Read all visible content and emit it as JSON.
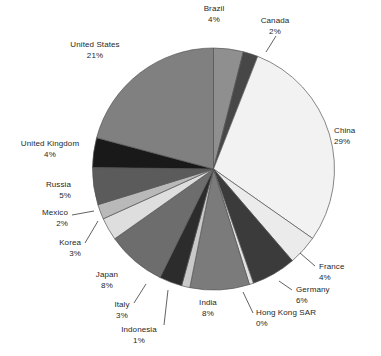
{
  "chart_data": {
    "type": "pie",
    "title": "",
    "subtitle": "",
    "xlabel": "",
    "ylabel": "",
    "legend_position": "none",
    "grid": false,
    "start_angle_deg": 0,
    "direction": "clockwise",
    "categories": [
      "Brazil",
      "Canada",
      "China",
      "France",
      "Germany",
      "Hong Kong SAR",
      "India",
      "Indonesia",
      "Italy",
      "Japan",
      "Korea",
      "Mexico",
      "Russia",
      "United Kingdom",
      "United States"
    ],
    "values": [
      4,
      2,
      29,
      4,
      6,
      0,
      8,
      1,
      3,
      8,
      3,
      2,
      5,
      4,
      21
    ],
    "value_unit": "%",
    "slices": [
      {
        "label": "Brazil",
        "pct_text": "4%",
        "value": 4,
        "sweep": 14.4,
        "color": "#8f8f8f"
      },
      {
        "label": "Canada",
        "pct_text": "2%",
        "value": 2,
        "sweep": 7.2,
        "color": "#474747"
      },
      {
        "label": "China",
        "pct_text": "29%",
        "value": 29,
        "sweep": 104.4,
        "color": "#f2f2f2"
      },
      {
        "label": "France",
        "pct_text": "4%",
        "value": 4,
        "sweep": 14.4,
        "color": "#ebebeb"
      },
      {
        "label": "Germany",
        "pct_text": "6%",
        "value": 6,
        "sweep": 21.6,
        "color": "#3b3b3b"
      },
      {
        "label": "Hong Kong SAR",
        "pct_text": "0%",
        "value": 0,
        "sweep": 2.0,
        "color": "#e2e2e2"
      },
      {
        "label": "India",
        "pct_text": "8%",
        "value": 8,
        "sweep": 28.8,
        "color": "#7b7b7b"
      },
      {
        "label": "Indonesia",
        "pct_text": "1%",
        "value": 1,
        "sweep": 4.0,
        "color": "#c9c9c9"
      },
      {
        "label": "Italy",
        "pct_text": "3%",
        "value": 3,
        "sweep": 11.0,
        "color": "#2c2c2c"
      },
      {
        "label": "Japan",
        "pct_text": "8%",
        "value": 8,
        "sweep": 28.8,
        "color": "#6d6d6d"
      },
      {
        "label": "Korea",
        "pct_text": "3%",
        "value": 3,
        "sweep": 11.0,
        "color": "#dedede"
      },
      {
        "label": "Mexico",
        "pct_text": "2%",
        "value": 2,
        "sweep": 7.2,
        "color": "#b9b9b9"
      },
      {
        "label": "Russia",
        "pct_text": "5%",
        "value": 5,
        "sweep": 18.0,
        "color": "#5b5b5b"
      },
      {
        "label": "United Kingdom",
        "pct_text": "4%",
        "value": 4,
        "sweep": 14.4,
        "color": "#191919"
      },
      {
        "label": "United States",
        "pct_text": "21%",
        "value": 21,
        "sweep": 75.6,
        "color": "#808080"
      }
    ]
  },
  "labels": {
    "brazil": {
      "name": "Brazil",
      "pct": "4%"
    },
    "canada": {
      "name": "Canada",
      "pct": "2%"
    },
    "china": {
      "name": "China",
      "pct": "29%"
    },
    "france": {
      "name": "France",
      "pct": "4%"
    },
    "germany": {
      "name": "Germany",
      "pct": "6%"
    },
    "hongkong": {
      "name": "Hong Kong SAR",
      "pct": "0%"
    },
    "india": {
      "name": "India",
      "pct": "8%"
    },
    "indonesia": {
      "name": "Indonesia",
      "pct": "1%"
    },
    "italy": {
      "name": "Italy",
      "pct": "3%"
    },
    "japan": {
      "name": "Japan",
      "pct": "8%"
    },
    "korea": {
      "name": "Korea",
      "pct": "3%"
    },
    "mexico": {
      "name": "Mexico",
      "pct": "2%"
    },
    "russia": {
      "name": "Russia",
      "pct": "5%"
    },
    "uk": {
      "name": "United Kingdom",
      "pct": "4%"
    },
    "us": {
      "name": "United States",
      "pct": "21%"
    }
  }
}
